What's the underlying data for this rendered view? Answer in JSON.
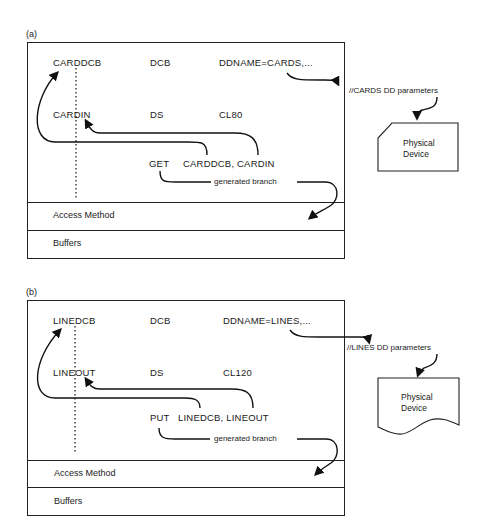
{
  "panels": [
    {
      "id": "a",
      "label": "(a)",
      "rows": [
        {
          "name": "CARDDCB",
          "op": "DCB",
          "operand": "DDNAME=CARDS,..."
        },
        {
          "name": "CARDIN",
          "op": "DS",
          "operand": "CL80"
        }
      ],
      "macro": {
        "op": "GET",
        "operands": "CARDDCB, CARDIN"
      },
      "generated_branch": "generated branch",
      "layers": [
        "Access Method",
        "Buffers"
      ],
      "dd_statement": "//CARDS DD parameters",
      "device": {
        "line1": "Physical",
        "line2": "Device",
        "shape": "punched-card"
      }
    },
    {
      "id": "b",
      "label": "(b)",
      "rows": [
        {
          "name": "LINEDCB",
          "op": "DCB",
          "operand": "DDNAME=LINES,..."
        },
        {
          "name": "LINEOUT",
          "op": "DS",
          "operand": "CL120"
        }
      ],
      "macro": {
        "op": "PUT",
        "operands": "LINEDCB, LINEOUT"
      },
      "generated_branch": "generated branch",
      "layers": [
        "Access Method",
        "Buffers"
      ],
      "dd_statement": "//LINES DD parameters",
      "device": {
        "line1": "Physical",
        "line2": "Device",
        "shape": "document"
      }
    }
  ]
}
